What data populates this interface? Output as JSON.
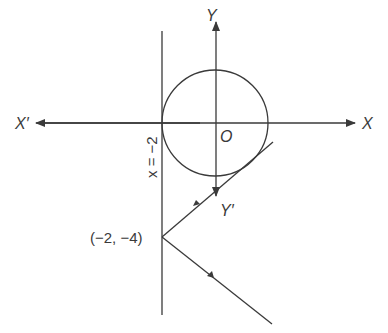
{
  "diagram": {
    "colors": {
      "line": "#3a3a3a",
      "background": "#ffffff"
    },
    "labels": {
      "x_axis_positive": "X",
      "x_axis_negative": "X′",
      "y_axis_positive": "Y",
      "y_axis_negative": "Y′",
      "origin": "O",
      "vertical_line": "x = −2",
      "reflection_point": "(−2, −4)"
    },
    "geometry": {
      "origin_px": [
        215,
        123
      ],
      "circle_radius_px": 53,
      "vertical_line_x_px": 162,
      "reflection_point_px": [
        162,
        237
      ]
    }
  }
}
